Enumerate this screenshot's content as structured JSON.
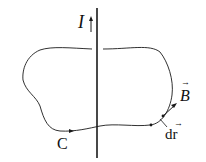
{
  "diagram": {
    "type": "ampere-loop",
    "labels": {
      "current": "I",
      "loop": "C",
      "field": "B",
      "element": "dr"
    },
    "colors": {
      "stroke": "#1a1a1a",
      "background": "#ffffff"
    }
  }
}
